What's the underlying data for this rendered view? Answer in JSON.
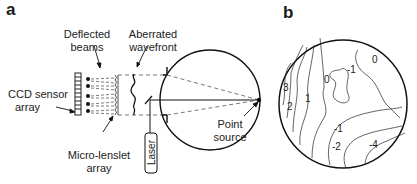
{
  "figure": {
    "panels": [
      {
        "id": "a",
        "label": "a"
      },
      {
        "id": "b",
        "label": "b"
      }
    ]
  },
  "panel_a": {
    "labels": {
      "deflected_beams": "Deflected\nbeams",
      "deflected_beams_line1": "Deflected",
      "deflected_beams_line2": "beams",
      "aberrated_line1": "Aberrated",
      "aberrated_line2": "wavefront",
      "ccd_line1": "CCD sensor",
      "ccd_line2": "array",
      "lenslet_line1": "Micro-lenslet",
      "lenslet_line2": "array",
      "point_line1": "Point",
      "point_line2": "source",
      "laser": "Laser"
    }
  },
  "panel_b": {
    "contour_labels": [
      "0",
      "-1",
      "0",
      "3",
      "1",
      "2",
      "-1",
      "-2",
      "-4"
    ]
  }
}
